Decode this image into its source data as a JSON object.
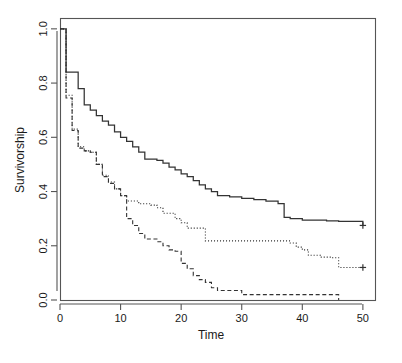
{
  "figure": {
    "background_color": "#ffffff",
    "plot_border_color": "#555555",
    "line_color": "#333333"
  },
  "chart_data": {
    "type": "line",
    "title": "",
    "subtitle": "",
    "xlabel": "Time",
    "ylabel": "Survivorship",
    "xlim": [
      0,
      52
    ],
    "ylim": [
      0.0,
      1.04
    ],
    "xticks": [
      0,
      10,
      20,
      30,
      40,
      50
    ],
    "xtick_labels": [
      "0",
      "10",
      "20",
      "30",
      "40",
      "50"
    ],
    "yticks": [
      0.0,
      0.2,
      0.4,
      0.6,
      0.8,
      1.0
    ],
    "ytick_labels": [
      "0.0",
      "0.2",
      "0.4",
      "0.6",
      "0.8",
      "1.0"
    ],
    "grid": false,
    "legend": false,
    "legend_position": "none",
    "step_type": "post",
    "annotations": [
      "censoring marks drawn as plus symbols at right end of solid and dotted curves"
    ],
    "series": [
      {
        "name": "group-1-solid",
        "style": "solid",
        "censored_points": [
          [
            50.0,
            0.275
          ]
        ],
        "x": [
          0,
          1,
          1,
          2,
          3,
          4,
          5,
          6,
          7,
          8,
          9,
          10,
          11,
          12,
          13,
          14,
          16,
          17,
          18,
          19,
          20,
          21,
          22,
          23,
          24,
          25,
          26,
          28,
          30,
          32,
          34,
          36,
          37,
          38,
          40,
          44,
          46,
          50
        ],
        "y": [
          1.0,
          1.0,
          0.84,
          0.84,
          0.78,
          0.72,
          0.7,
          0.68,
          0.66,
          0.645,
          0.62,
          0.6,
          0.585,
          0.565,
          0.545,
          0.52,
          0.515,
          0.505,
          0.49,
          0.48,
          0.465,
          0.455,
          0.44,
          0.425,
          0.41,
          0.4,
          0.385,
          0.38,
          0.375,
          0.37,
          0.365,
          0.355,
          0.305,
          0.3,
          0.295,
          0.292,
          0.29,
          0.275
        ]
      },
      {
        "name": "group-2-dotted",
        "style": "dotted",
        "censored_points": [
          [
            50.0,
            0.12
          ]
        ],
        "x": [
          0,
          1,
          1,
          2,
          3,
          4,
          5,
          6,
          7,
          8,
          9,
          10,
          11,
          13,
          15,
          16,
          17,
          18,
          19,
          20,
          21,
          24,
          30,
          36,
          38,
          39,
          40,
          41,
          43,
          45,
          46,
          50
        ],
        "y": [
          1.0,
          1.0,
          0.755,
          0.63,
          0.565,
          0.55,
          0.545,
          0.5,
          0.46,
          0.435,
          0.41,
          0.385,
          0.365,
          0.355,
          0.35,
          0.34,
          0.32,
          0.32,
          0.3,
          0.285,
          0.265,
          0.218,
          0.218,
          0.218,
          0.21,
          0.195,
          0.185,
          0.165,
          0.158,
          0.156,
          0.12,
          0.12
        ]
      },
      {
        "name": "group-3-dashed",
        "style": "dashed",
        "censored_points": [],
        "x": [
          0,
          1,
          1,
          2,
          3,
          4,
          5,
          6,
          7,
          8,
          9,
          10,
          11,
          11,
          12,
          13,
          14,
          16,
          17,
          18,
          19,
          20,
          20,
          21,
          22,
          23,
          24,
          25,
          26,
          30,
          44,
          46,
          46
        ],
        "y": [
          1.0,
          1.0,
          0.745,
          0.625,
          0.56,
          0.55,
          0.545,
          0.5,
          0.455,
          0.43,
          0.41,
          0.385,
          0.36,
          0.3,
          0.275,
          0.245,
          0.225,
          0.215,
          0.2,
          0.185,
          0.18,
          0.175,
          0.135,
          0.115,
          0.09,
          0.075,
          0.065,
          0.045,
          0.035,
          0.02,
          0.02,
          0.02,
          0.0
        ]
      }
    ]
  }
}
